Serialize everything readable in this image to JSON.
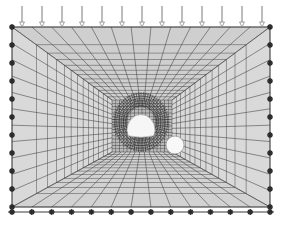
{
  "figure": {
    "type": "fem-mesh-perspective-view",
    "background_color": "#ffffff"
  },
  "canvas": {
    "width": 282,
    "height": 228
  },
  "colors": {
    "mesh_line": "#4a4a4a",
    "mesh_line_light": "#6f6f6f",
    "mesh_line_dense": "#2b2b2b",
    "wall_fill": "#d9d9d9",
    "ceiling_fill": "#cfcfcf",
    "floor_fill": "#d2d2d2",
    "far_fill": "#b8b8b8",
    "support_marker": "#2a2a2a",
    "load_arrow": "#7a7a7a",
    "opening_fill": "#f4f4f4",
    "frame_edge": "#3a3a3a"
  },
  "outer_box": {
    "label": "outer boundary rectangle",
    "left": 12,
    "top": 27,
    "right": 270,
    "bottom": 207
  },
  "vanishing_point": {
    "x": 140,
    "y": 122
  },
  "inner_box": {
    "label": "far-field rectangle at tunnel depth",
    "left": 112,
    "top": 100,
    "right": 172,
    "bottom": 152
  },
  "mesh": {
    "wall_divisions": 11,
    "depth_divisions": 13,
    "floor_rows": 12,
    "ceiling_rows": 8
  },
  "tunnel_face": {
    "label": "horseshoe tunnel opening",
    "shape": "arch",
    "center_x": 141,
    "center_y": 122,
    "radius_x": 14,
    "radius_y": 15,
    "fill": "#f6f6f6"
  },
  "secondary_opening": {
    "label": "circular borehole opening",
    "center_x": 175,
    "center_y": 145,
    "radius": 9,
    "fill": "#f8f8f8"
  },
  "loads": {
    "label": "distributed vertical surface load",
    "direction": "downward",
    "count": 13,
    "arrow_top_y": 6,
    "arrow_tip_y": 27,
    "x_start": 22,
    "x_end": 262
  },
  "supports": {
    "label": "fixed boundary supports",
    "marker_shape": "star",
    "left_count": 10,
    "right_count": 10,
    "bottom_count": 13,
    "corner_count": 4
  },
  "base_line": {
    "label": "ground base reference line",
    "y": 212,
    "x_start": 8,
    "x_end": 274
  }
}
